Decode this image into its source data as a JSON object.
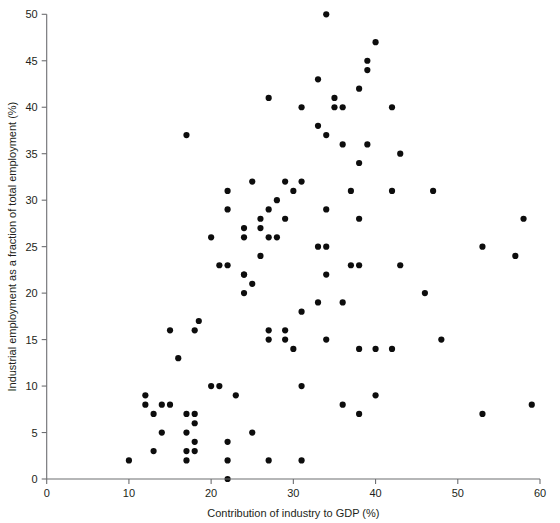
{
  "chart_data": {
    "type": "scatter",
    "title": "",
    "xlabel": "Contribution of industry to GDP (%)",
    "ylabel": "Industrial employment as a fraction of total employment (%)",
    "xlim": [
      0,
      60
    ],
    "ylim": [
      0,
      50
    ],
    "xticks": [
      0,
      10,
      20,
      30,
      40,
      50,
      60
    ],
    "yticks": [
      0,
      5,
      10,
      15,
      20,
      25,
      30,
      35,
      40,
      45,
      50
    ],
    "grid": false,
    "legend": null,
    "marker": {
      "shape": "circle",
      "color": "#0d0d0d",
      "size_px": 5.2
    },
    "points": [
      [
        10,
        2
      ],
      [
        12,
        9
      ],
      [
        12,
        8
      ],
      [
        13,
        7
      ],
      [
        13,
        3
      ],
      [
        14,
        8
      ],
      [
        14,
        5
      ],
      [
        15,
        8
      ],
      [
        15,
        16
      ],
      [
        16,
        13
      ],
      [
        17,
        37
      ],
      [
        17,
        7
      ],
      [
        17,
        5
      ],
      [
        17,
        3
      ],
      [
        17,
        2
      ],
      [
        18,
        7
      ],
      [
        18,
        6
      ],
      [
        18,
        4
      ],
      [
        18,
        3
      ],
      [
        18.5,
        17
      ],
      [
        18,
        16
      ],
      [
        20,
        10
      ],
      [
        20,
        26
      ],
      [
        21,
        10
      ],
      [
        21,
        23
      ],
      [
        22,
        31
      ],
      [
        22,
        29
      ],
      [
        22,
        23
      ],
      [
        22,
        0
      ],
      [
        22,
        4
      ],
      [
        22,
        2
      ],
      [
        23,
        9
      ],
      [
        24,
        22
      ],
      [
        24,
        27
      ],
      [
        24,
        26
      ],
      [
        24,
        20
      ],
      [
        24,
        22
      ],
      [
        25,
        32
      ],
      [
        25,
        21
      ],
      [
        25,
        5
      ],
      [
        26,
        28
      ],
      [
        26,
        27
      ],
      [
        26,
        24
      ],
      [
        27,
        26
      ],
      [
        27,
        29
      ],
      [
        27,
        16
      ],
      [
        27,
        15
      ],
      [
        27,
        41
      ],
      [
        27,
        2
      ],
      [
        28,
        30
      ],
      [
        28,
        26
      ],
      [
        29,
        28
      ],
      [
        29,
        16
      ],
      [
        29,
        15
      ],
      [
        29,
        32
      ],
      [
        30,
        31
      ],
      [
        30,
        14
      ],
      [
        31,
        40
      ],
      [
        31,
        18
      ],
      [
        31,
        32
      ],
      [
        31,
        2
      ],
      [
        31,
        10
      ],
      [
        33,
        43
      ],
      [
        33,
        38
      ],
      [
        33,
        19
      ],
      [
        33,
        25
      ],
      [
        34,
        50
      ],
      [
        34,
        37
      ],
      [
        34,
        22
      ],
      [
        34,
        29
      ],
      [
        34,
        25
      ],
      [
        34,
        15
      ],
      [
        35,
        41
      ],
      [
        35,
        40
      ],
      [
        36,
        40
      ],
      [
        36,
        36
      ],
      [
        36,
        19
      ],
      [
        36,
        8
      ],
      [
        37,
        31
      ],
      [
        37,
        23
      ],
      [
        38,
        42
      ],
      [
        38,
        34
      ],
      [
        38,
        28
      ],
      [
        38,
        23
      ],
      [
        38,
        14
      ],
      [
        38,
        7
      ],
      [
        39,
        45
      ],
      [
        39,
        44
      ],
      [
        39,
        36
      ],
      [
        40,
        47
      ],
      [
        40,
        14
      ],
      [
        40,
        9
      ],
      [
        42,
        40
      ],
      [
        42,
        31
      ],
      [
        42,
        14
      ],
      [
        43,
        35
      ],
      [
        43,
        23
      ],
      [
        46,
        20
      ],
      [
        47,
        31
      ],
      [
        48,
        15
      ],
      [
        53,
        25
      ],
      [
        53,
        7
      ],
      [
        57,
        24
      ],
      [
        58,
        28
      ],
      [
        59,
        8
      ]
    ]
  },
  "axes": {
    "x_tick_labels": [
      "0",
      "10",
      "20",
      "30",
      "40",
      "50",
      "60"
    ],
    "y_tick_labels": [
      "0",
      "5",
      "10",
      "15",
      "20",
      "25",
      "30",
      "35",
      "40",
      "45",
      "50"
    ],
    "x_axis_title": "Contribution of industry to GDP (%)",
    "y_axis_title": "Industrial employment as a fraction of total employment (%)"
  }
}
